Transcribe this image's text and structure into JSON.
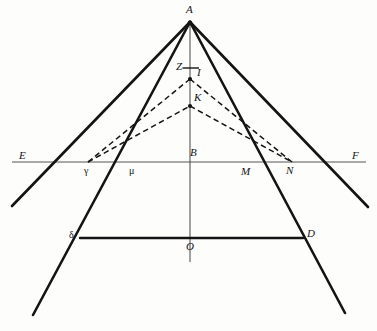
{
  "figure": {
    "kind": "geometric-diagram",
    "title": "",
    "background_color": "#fdfdfc",
    "stroke_color": "#141414",
    "axis_color": "#555555",
    "width": 377,
    "height": 331,
    "points": {
      "A": {
        "label": "A",
        "x": 190,
        "y": 22,
        "label_x": 186,
        "label_y": 5
      },
      "Z": {
        "label": "Z",
        "x": 190,
        "y": 68,
        "label_x": 177,
        "label_y": 62
      },
      "I": {
        "label": "I",
        "x": 190,
        "y": 79,
        "label_x": 196,
        "label_y": 69
      },
      "K": {
        "label": "K",
        "x": 190,
        "y": 106,
        "label_x": 194,
        "label_y": 94
      },
      "B": {
        "label": "B",
        "x": 190,
        "y": 162,
        "label_x": 190,
        "label_y": 148
      },
      "E": {
        "label": "E",
        "x": 12,
        "y": 162,
        "label_x": 20,
        "label_y": 151
      },
      "F": {
        "label": "F",
        "x": 366,
        "y": 162,
        "label_x": 352,
        "label_y": 151
      },
      "gamma": {
        "label": "γ",
        "x": 88,
        "y": 162,
        "label_x": 84,
        "label_y": 166
      },
      "mu": {
        "label": "μ",
        "x": 133,
        "y": 162,
        "label_x": 129,
        "label_y": 166
      },
      "M": {
        "label": "M",
        "x": 248,
        "y": 162,
        "label_x": 242,
        "label_y": 166
      },
      "N": {
        "label": "N",
        "x": 292,
        "y": 162,
        "label_x": 288,
        "label_y": 166
      },
      "delta": {
        "label": "δ",
        "x": 80,
        "y": 238,
        "label_x": 69,
        "label_y": 231
      },
      "O": {
        "label": "O",
        "x": 190,
        "y": 238,
        "label_x": 187,
        "label_y": 241
      },
      "D": {
        "label": "D",
        "x": 303,
        "y": 238,
        "label_x": 307,
        "label_y": 229
      }
    },
    "segments": [
      {
        "name": "axis-EF",
        "from": [
          12,
          162
        ],
        "to": [
          366,
          162
        ],
        "style": "thin",
        "weight": 1.0
      },
      {
        "name": "vertical-AB-O",
        "from": [
          190,
          22
        ],
        "to": [
          190,
          262
        ],
        "style": "thin",
        "weight": 1.1
      },
      {
        "name": "outer-left-ray",
        "from": [
          190,
          22
        ],
        "to": [
          12,
          206
        ],
        "style": "solid",
        "weight": 2.6
      },
      {
        "name": "outer-right-ray",
        "from": [
          190,
          22
        ],
        "to": [
          368,
          207
        ],
        "style": "solid",
        "weight": 2.6
      },
      {
        "name": "inner-left-ray",
        "from": [
          190,
          22
        ],
        "to": [
          33,
          315
        ],
        "style": "solid",
        "weight": 2.6
      },
      {
        "name": "inner-right-ray",
        "from": [
          190,
          22
        ],
        "to": [
          345,
          313
        ],
        "style": "solid",
        "weight": 2.6
      },
      {
        "name": "chord-delta-D",
        "from": [
          80,
          238
        ],
        "to": [
          303,
          238
        ],
        "style": "solid",
        "weight": 2.4
      },
      {
        "name": "dashed-gamma-I",
        "from": [
          88,
          162
        ],
        "to": [
          190,
          79
        ],
        "style": "dashed",
        "weight": 1.5
      },
      {
        "name": "dashed-I-N",
        "from": [
          190,
          79
        ],
        "to": [
          292,
          162
        ],
        "style": "dashed",
        "weight": 1.5
      },
      {
        "name": "dashed-gamma-K",
        "from": [
          88,
          162
        ],
        "to": [
          190,
          106
        ],
        "style": "dashed",
        "weight": 1.5
      },
      {
        "name": "dashed-K-N",
        "from": [
          190,
          106
        ],
        "to": [
          292,
          162
        ],
        "style": "dashed",
        "weight": 1.5
      },
      {
        "name": "tick-Z",
        "from": [
          183,
          68
        ],
        "to": [
          199,
          68
        ],
        "style": "thin",
        "weight": 1.3
      }
    ],
    "markers": [
      {
        "name": "vertex-A",
        "x": 190,
        "y": 22,
        "r": 2.2
      },
      {
        "name": "vertex-I",
        "x": 190,
        "y": 79,
        "r": 2.0
      },
      {
        "name": "vertex-K",
        "x": 190,
        "y": 106,
        "r": 2.0
      }
    ]
  }
}
